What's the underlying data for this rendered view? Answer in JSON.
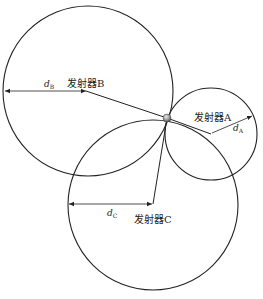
{
  "diagram": {
    "type": "trilateration",
    "receiver": {
      "name": "receiver-point",
      "x": 167,
      "y": 118
    },
    "transmitters": [
      {
        "id": "B",
        "label": "发射器B",
        "distance_var": "d",
        "distance_sub": "B",
        "cx": 88,
        "cy": 90,
        "r": 84
      },
      {
        "id": "A",
        "label": "发射器A",
        "distance_var": "d",
        "distance_sub": "A",
        "cx": 211,
        "cy": 134,
        "r": 46
      },
      {
        "id": "C",
        "label": "发射器C",
        "distance_var": "d",
        "distance_sub": "C",
        "cx": 153,
        "cy": 204,
        "r": 85
      }
    ]
  },
  "labels": {
    "tx_b": "发射器B",
    "tx_a": "发射器A",
    "tx_c": "发射器C",
    "d": "d",
    "sub_b": "B",
    "sub_a": "A",
    "sub_c": "C"
  },
  "colors": {
    "stroke": "#222222",
    "ball": "#9a9a9a"
  }
}
